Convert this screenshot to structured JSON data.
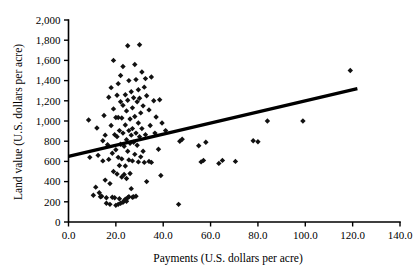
{
  "chart_data": {
    "type": "scatter",
    "title": "",
    "xlabel": "Payments (U.S. dollars per acre)",
    "ylabel": "Land value (U.S. dollars per acre)",
    "xlim": [
      0.0,
      140.0
    ],
    "ylim": [
      0,
      2000
    ],
    "xticks": [
      0.0,
      20.0,
      40.0,
      60.0,
      80.0,
      100.0,
      120.0,
      140.0
    ],
    "yticks": [
      0,
      200,
      400,
      600,
      800,
      1000,
      1200,
      1400,
      1600,
      1800,
      2000
    ],
    "xtick_labels": [
      "0.0",
      "20.0",
      "40.0",
      "60.0",
      "80.0",
      "100.0",
      "120.0",
      "140.0"
    ],
    "ytick_labels": [
      "0",
      "200",
      "400",
      "600",
      "800",
      "1,000",
      "1,200",
      "1,400",
      "1,600",
      "1,800",
      "2,000"
    ],
    "grid": false,
    "legend": false,
    "marker": "diamond",
    "marker_color": "#111111",
    "point_count": 138,
    "trendline": {
      "type": "linear",
      "color": "#000000",
      "x_start": 0.0,
      "y_start": 650,
      "x_end": 122.0,
      "y_end": 1320,
      "slope": 5.49,
      "intercept": 650
    },
    "points": [
      [
        8.5,
        1010
      ],
      [
        9.0,
        640
      ],
      [
        10.5,
        265
      ],
      [
        11.5,
        345
      ],
      [
        12.0,
        930
      ],
      [
        12.5,
        660
      ],
      [
        13.0,
        290
      ],
      [
        13.5,
        250
      ],
      [
        14.0,
        255
      ],
      [
        14.5,
        805
      ],
      [
        14.5,
        605
      ],
      [
        15.0,
        1055
      ],
      [
        15.5,
        860
      ],
      [
        15.5,
        415
      ],
      [
        16.0,
        240
      ],
      [
        16.0,
        185
      ],
      [
        16.5,
        765
      ],
      [
        17.0,
        1235
      ],
      [
        17.0,
        620
      ],
      [
        17.5,
        380
      ],
      [
        17.5,
        175
      ],
      [
        18.0,
        1330
      ],
      [
        18.0,
        955
      ],
      [
        18.5,
        680
      ],
      [
        18.5,
        245
      ],
      [
        19.0,
        1600
      ],
      [
        19.0,
        1120
      ],
      [
        19.0,
        500
      ],
      [
        19.5,
        865
      ],
      [
        19.5,
        240
      ],
      [
        20.0,
        1035
      ],
      [
        20.0,
        715
      ],
      [
        20.0,
        165
      ],
      [
        20.5,
        1255
      ],
      [
        20.5,
        845
      ],
      [
        20.5,
        475
      ],
      [
        21.0,
        1370
      ],
      [
        21.0,
        1035
      ],
      [
        21.0,
        640
      ],
      [
        21.0,
        175
      ],
      [
        21.5,
        905
      ],
      [
        21.5,
        560
      ],
      [
        21.5,
        230
      ],
      [
        22.0,
        1450
      ],
      [
        22.0,
        1190
      ],
      [
        22.0,
        770
      ],
      [
        22.0,
        185
      ],
      [
        22.5,
        1030
      ],
      [
        22.5,
        625
      ],
      [
        22.5,
        445
      ],
      [
        23.0,
        1540
      ],
      [
        23.0,
        1155
      ],
      [
        23.0,
        880
      ],
      [
        23.0,
        195
      ],
      [
        23.5,
        750
      ],
      [
        23.5,
        470
      ],
      [
        23.5,
        210
      ],
      [
        24.0,
        1260
      ],
      [
        24.0,
        960
      ],
      [
        24.0,
        555
      ],
      [
        24.0,
        225
      ],
      [
        24.5,
        1100
      ],
      [
        24.5,
        815
      ],
      [
        24.5,
        430
      ],
      [
        24.5,
        205
      ],
      [
        25.0,
        1745
      ],
      [
        25.0,
        1205
      ],
      [
        25.0,
        700
      ],
      [
        25.0,
        240
      ],
      [
        25.5,
        1400
      ],
      [
        25.5,
        905
      ],
      [
        25.5,
        615
      ],
      [
        25.5,
        250
      ],
      [
        26.0,
        1020
      ],
      [
        26.0,
        780
      ],
      [
        26.0,
        480
      ],
      [
        26.5,
        1290
      ],
      [
        26.5,
        860
      ],
      [
        26.5,
        330
      ],
      [
        27.0,
        1130
      ],
      [
        27.0,
        925
      ],
      [
        27.0,
        605
      ],
      [
        27.0,
        245
      ],
      [
        27.5,
        1230
      ],
      [
        27.5,
        790
      ],
      [
        27.5,
        250
      ],
      [
        28.0,
        1560
      ],
      [
        28.0,
        1045
      ],
      [
        28.0,
        670
      ],
      [
        28.5,
        1410
      ],
      [
        28.5,
        880
      ],
      [
        28.5,
        255
      ],
      [
        29.0,
        1190
      ],
      [
        29.0,
        760
      ],
      [
        29.5,
        1310
      ],
      [
        29.5,
        980
      ],
      [
        29.5,
        595
      ],
      [
        30.0,
        1755
      ],
      [
        30.0,
        1225
      ],
      [
        30.0,
        845
      ],
      [
        30.5,
        1080
      ],
      [
        30.5,
        645
      ],
      [
        31.0,
        1485
      ],
      [
        31.0,
        925
      ],
      [
        31.5,
        1150
      ],
      [
        31.5,
        700
      ],
      [
        32.0,
        1335
      ],
      [
        32.0,
        590
      ],
      [
        32.5,
        1420
      ],
      [
        32.5,
        865
      ],
      [
        33.0,
        1250
      ],
      [
        33.0,
        400
      ],
      [
        34.0,
        1110
      ],
      [
        34.0,
        600
      ],
      [
        34.5,
        955
      ],
      [
        35.0,
        1435
      ],
      [
        35.0,
        590
      ],
      [
        36.0,
        1200
      ],
      [
        36.5,
        880
      ],
      [
        37.0,
        1040
      ],
      [
        38.0,
        720
      ],
      [
        38.5,
        1210
      ],
      [
        39.0,
        460
      ],
      [
        39.5,
        980
      ],
      [
        41.0,
        905
      ],
      [
        46.5,
        175
      ],
      [
        47.0,
        800
      ],
      [
        48.0,
        820
      ],
      [
        55.0,
        755
      ],
      [
        56.0,
        595
      ],
      [
        57.0,
        610
      ],
      [
        58.0,
        790
      ],
      [
        63.5,
        580
      ],
      [
        65.0,
        610
      ],
      [
        70.5,
        600
      ],
      [
        78.0,
        805
      ],
      [
        80.0,
        795
      ],
      [
        84.0,
        1000
      ],
      [
        99.0,
        1000
      ],
      [
        119.0,
        1500
      ]
    ]
  },
  "axis": {
    "y_title": "Land value (U.S. dollars per acre)",
    "x_title": "Payments (U.S. dollars per acre)"
  }
}
